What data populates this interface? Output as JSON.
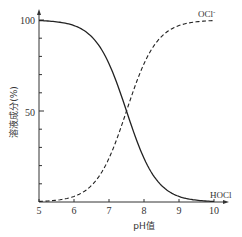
{
  "chart_data": {
    "type": "line",
    "title": "",
    "xlabel": "pH值",
    "ylabel": "溶液成分(%)",
    "xlim": [
      5,
      10
    ],
    "ylim": [
      0,
      100
    ],
    "x_ticks": [
      5,
      6,
      7,
      8,
      9,
      10
    ],
    "y_ticks_labeled": [
      50,
      100
    ],
    "y_minor_tick_step": 10,
    "grid": false,
    "legend": "inline labels at curve ends",
    "x": [
      5.0,
      5.5,
      6.0,
      6.5,
      7.0,
      7.5,
      8.0,
      8.5,
      9.0,
      9.5,
      10.0
    ],
    "series": [
      {
        "name": "HOCl",
        "style": "solid",
        "values": [
          99.7,
          99.0,
          96.9,
          90.9,
          76.0,
          50.0,
          24.0,
          9.1,
          3.1,
          1.0,
          0.3
        ]
      },
      {
        "name": "OCl⁻",
        "style": "dashed",
        "values": [
          0.3,
          1.0,
          3.1,
          9.1,
          24.0,
          50.0,
          76.0,
          90.9,
          96.9,
          99.0,
          99.7
        ]
      }
    ],
    "annotations": [
      {
        "text": "OCl⁻",
        "near": "upper right end of dashed curve"
      },
      {
        "text": "HOCl",
        "near": "lower right end of solid curve"
      }
    ]
  },
  "labels": {
    "y_tick_100": "100",
    "y_tick_50": "50",
    "x_tick_5": "5",
    "x_tick_6": "6",
    "x_tick_7": "7",
    "x_tick_8": "8",
    "x_tick_9": "9",
    "x_tick_10": "10",
    "xlabel": "pH值",
    "ylabel": "溶液成分(%)",
    "ocl_label": "OCl",
    "ocl_sup": "-",
    "hocl_label": "HOCl"
  },
  "colors": {
    "axis": "#333333",
    "curve": "#222222",
    "background": "#ffffff"
  }
}
